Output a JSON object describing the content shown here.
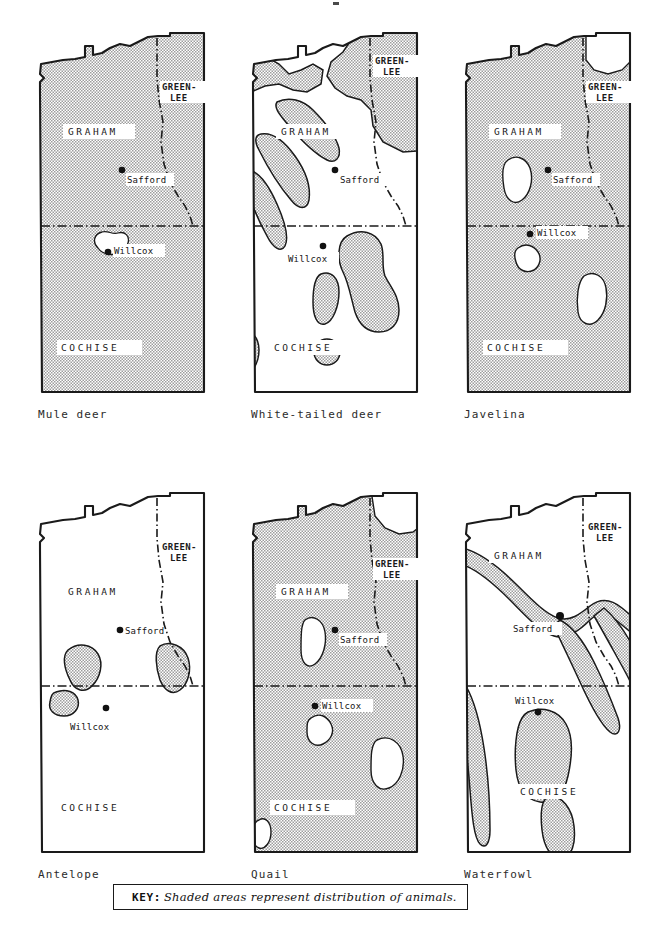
{
  "figure": {
    "type": "thematic-distribution-maps",
    "county_region": "Graham and Cochise Counties, Arizona (with Greenlee)",
    "columns": 3,
    "rows": 2
  },
  "common": {
    "county_labels": [
      "GRAHAM",
      "COCHISE"
    ],
    "greenlee_label_line1": "GREEN-",
    "greenlee_label_line2": "LEE",
    "cities": [
      "Safford",
      "Willcox"
    ],
    "shade_color": "#b8b8b8",
    "outline_color": "#1a1a1a",
    "white_color": "#ffffff"
  },
  "maps": [
    {
      "id": "mule-deer",
      "caption": "Mule deer",
      "distribution": "entire area shaded except one small unshaded pocket south-west of Willcox",
      "shaded_coverage": "near-total",
      "county_labels": [
        "GRAHAM",
        "COCHISE"
      ],
      "greenlee_line1": "GREEN-",
      "greenlee_line2": "LEE",
      "cities": [
        "Safford",
        "Willcox"
      ]
    },
    {
      "id": "white-tailed-deer",
      "caption": "White-tailed deer",
      "distribution": "narrow mountain-range bands in Graham County and scattered ranges in Cochise County",
      "shaded_coverage": "partial-bands",
      "county_labels": [
        "GRAHAM",
        "COCHISE"
      ],
      "greenlee_line1": "GREEN-",
      "greenlee_line2": "LEE",
      "cities": [
        "Safford",
        "Willcox"
      ]
    },
    {
      "id": "javelina",
      "caption": "Javelina",
      "distribution": "nearly the whole area shaded with three unshaded pockets",
      "shaded_coverage": "near-total",
      "county_labels": [
        "GRAHAM",
        "COCHISE"
      ],
      "greenlee_line1": "GREEN-",
      "greenlee_line2": "LEE",
      "cities": [
        "Safford",
        "Willcox"
      ]
    },
    {
      "id": "antelope",
      "caption": "Antelope",
      "distribution": "three small isolated shaded patches near the Graham/Cochise county line",
      "shaded_coverage": "sparse",
      "county_labels": [
        "GRAHAM",
        "COCHISE"
      ],
      "greenlee_line1": "GREEN-",
      "greenlee_line2": "LEE",
      "cities": [
        "Safford",
        "Willcox"
      ]
    },
    {
      "id": "quail",
      "caption": "Quail",
      "distribution": "almost all shaded, with unshaded mountain pockets and the far north-east corner",
      "shaded_coverage": "near-total",
      "county_labels": [
        "GRAHAM",
        "COCHISE"
      ],
      "greenlee_line1": "GREEN-",
      "greenlee_line2": "LEE",
      "cities": [
        "Safford",
        "Willcox"
      ]
    },
    {
      "id": "waterfowl",
      "caption": "Waterfowl",
      "distribution": "ribbon-like shaded corridors following river valleys plus a basin south of Willcox",
      "shaded_coverage": "corridors",
      "county_labels": [
        "GRAHAM",
        "COCHISE"
      ],
      "greenlee_line1": "GREEN-",
      "greenlee_line2": "LEE",
      "cities": [
        "Safford",
        "Willcox"
      ]
    }
  ],
  "key": {
    "label": "KEY:",
    "text": "Shaded areas represent  distribution of  animals."
  }
}
